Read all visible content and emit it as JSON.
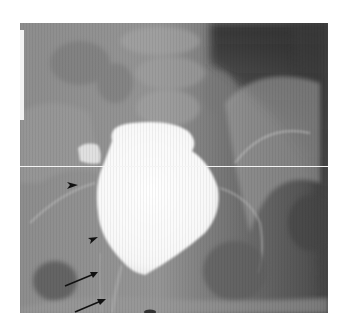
{
  "image": {
    "description": "Pelvic radiograph (cystogram) showing contrast-filled urinary bladder with arrowheads and arrows marking structures along the left side of the bladder and urethra",
    "colors": {
      "background": "#ffffff",
      "film_mid": "#8a8a8a",
      "film_dark": "#3a3a3a",
      "contrast": "#fbfbfb",
      "annotation": "#111111"
    },
    "annotations": {
      "arrowheads": [
        {
          "x": 72,
          "y": 185,
          "direction": "right"
        },
        {
          "x": 93,
          "y": 240,
          "direction": "right"
        }
      ],
      "arrows": [
        {
          "from": [
            65,
            286
          ],
          "to": [
            98,
            273
          ]
        },
        {
          "from": [
            75,
            312
          ],
          "to": [
            105,
            300
          ]
        }
      ]
    }
  }
}
